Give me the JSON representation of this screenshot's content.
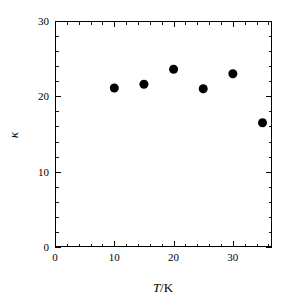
{
  "chart_data": {
    "type": "scatter",
    "title": "",
    "subtitle": "",
    "xlabel": "T/K",
    "xlabel_parts": {
      "italic": "T",
      "separator": "/",
      "roman": "K"
    },
    "ylabel": "κ",
    "ylabel_name": "kappa",
    "xlim": [
      0,
      36.6
    ],
    "ylim": [
      0,
      30
    ],
    "x_major_ticks": [
      0,
      10,
      20,
      30
    ],
    "x_major_tick_labels": [
      "0",
      "10",
      "20",
      "30"
    ],
    "x_minor_tick_step": 2,
    "y_major_ticks": [
      0,
      10,
      20,
      30
    ],
    "y_major_tick_labels": [
      "0",
      "10",
      "20",
      "30"
    ],
    "y_minor_tick_step": 2,
    "grid": false,
    "legend": false,
    "legend_position": "none",
    "marker": "filled-circle",
    "marker_color": "#000000",
    "marker_size_px": 9,
    "series": [
      {
        "name": "kappa vs T",
        "x": [
          10,
          15,
          20,
          25,
          30,
          35
        ],
        "y": [
          21.1,
          21.6,
          23.6,
          21.0,
          23.0,
          16.5
        ]
      }
    ],
    "points": [
      {
        "x": 10,
        "y": 21.1
      },
      {
        "x": 15,
        "y": 21.6
      },
      {
        "x": 20,
        "y": 23.6
      },
      {
        "x": 25,
        "y": 21.0
      },
      {
        "x": 30,
        "y": 23.0
      },
      {
        "x": 35,
        "y": 16.5
      }
    ]
  },
  "figure": {
    "background_color": "#ffffff",
    "axis_color": "#000000",
    "width_px": 293,
    "height_px": 305
  },
  "plot_box": {
    "left_px": 55,
    "top_px": 21,
    "right_px": 272,
    "bottom_px": 247
  }
}
